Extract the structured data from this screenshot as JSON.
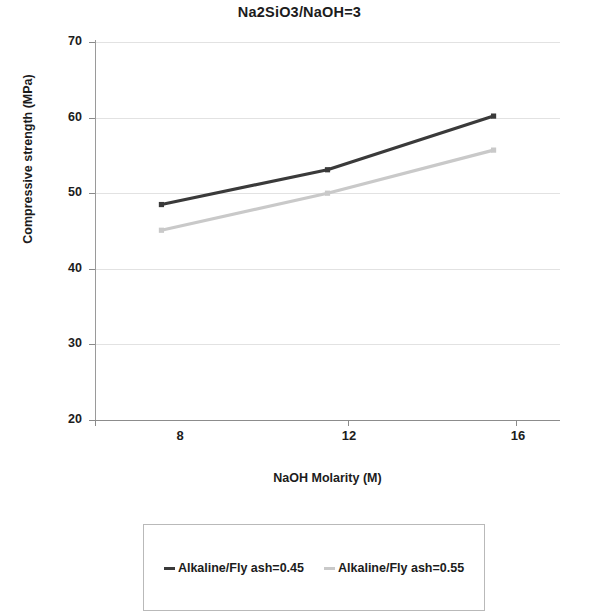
{
  "chart_data": {
    "type": "line",
    "title": "Na2SiO3/NaOH=3",
    "xlabel": "NaOH Molarity (M)",
    "ylabel": "Compressive strength (MPa)",
    "x": [
      8,
      12,
      16
    ],
    "xtick_labels": [
      "8",
      "12",
      "16"
    ],
    "ytick_labels": [
      "20",
      "30",
      "40",
      "50",
      "60",
      "70"
    ],
    "ylim": [
      20,
      70
    ],
    "xlim": [
      6.4,
      17.6
    ],
    "grid": true,
    "legend_position": "bottom",
    "series": [
      {
        "name": "Alkaline/Fly ash=0.45",
        "values": [
          48.5,
          53.1,
          60.2
        ],
        "color": "#3a3a3a"
      },
      {
        "name": "Alkaline/Fly ash=0.55",
        "values": [
          45.1,
          50.0,
          55.7
        ],
        "color": "#c9c9c9"
      }
    ]
  },
  "axes": {
    "yticks": [
      {
        "label": "70",
        "value": 70
      },
      {
        "label": "60",
        "value": 60
      },
      {
        "label": "50",
        "value": 50
      },
      {
        "label": "40",
        "value": 40
      },
      {
        "label": "30",
        "value": 30
      },
      {
        "label": "20",
        "value": 20
      }
    ],
    "xticks": [
      {
        "label": "8",
        "value": 8
      },
      {
        "label": "12",
        "value": 12
      },
      {
        "label": "16",
        "value": 16
      }
    ]
  },
  "legend": {
    "entries": [
      {
        "label": "Alkaline/Fly ash=0.45",
        "color": "#3a3a3a"
      },
      {
        "label": "Alkaline/Fly ash=0.55",
        "color": "#c9c9c9"
      }
    ]
  }
}
